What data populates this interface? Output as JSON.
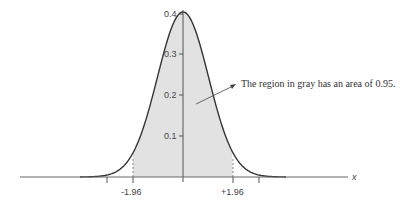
{
  "chart_data": {
    "type": "area",
    "title": "",
    "xlabel": "x",
    "ylabel": "",
    "distribution": "standard normal",
    "x_ticks": [
      "-1.96",
      "+1.96"
    ],
    "y_ticks": [
      "0.1",
      "0.2",
      "0.3",
      "0.4"
    ],
    "ylim": [
      0,
      0.4
    ],
    "shaded_region": {
      "from": -1.96,
      "to": 1.96,
      "area": 0.95,
      "color": "#e2e2e2"
    },
    "annotation": "The region in gray has an area  of  0.95.",
    "grid": false
  },
  "labels": {
    "y01": "0.1",
    "y02": "0.2",
    "y03": "0.3",
    "y04": "0.4",
    "xneg": "-1.96",
    "xpos": "+1.96",
    "xaxis": "x",
    "annotation": "The region in gray has an area  of  0.95."
  },
  "colors": {
    "fill": "#e2e2e2",
    "curve": "#333333",
    "axis": "#555555"
  }
}
